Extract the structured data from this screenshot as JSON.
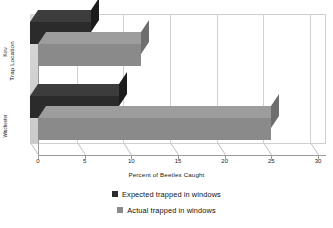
{
  "chart_data": {
    "type": "bar",
    "orientation": "horizontal",
    "style": "3d",
    "title": "",
    "xlabel": "Percent of Beetles Caught",
    "ylabel": "Trap Location",
    "categories": [
      "Kew",
      "Winchester"
    ],
    "series": [
      {
        "name": "Expected trapped in windows",
        "color": "#2b2b2b",
        "values": [
          6.5,
          9.5
        ]
      },
      {
        "name": "Actual trapped in windows",
        "color": "#8a8a8a",
        "values": [
          11,
          25
        ]
      }
    ],
    "xlim": [
      0,
      30
    ],
    "xticks": [
      "0",
      "5",
      "10",
      "15",
      "20",
      "25",
      "30"
    ],
    "grid": true,
    "legend_position": "bottom"
  },
  "legend": {
    "items": [
      {
        "label": "Expected trapped in windows",
        "swatch": "#2b2b2b"
      },
      {
        "label": "Actual trapped in windows",
        "swatch": "#8a8a8a"
      }
    ]
  },
  "axes": {
    "y_title": "Trap Location",
    "x_title": "Percent of Beetles Caught",
    "category_labels": [
      "Kew",
      "Winchester"
    ],
    "x_tick_labels": [
      "0",
      "5",
      "10",
      "15",
      "20",
      "25",
      "30"
    ]
  }
}
